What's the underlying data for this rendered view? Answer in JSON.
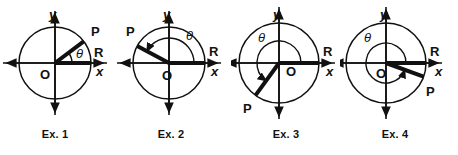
{
  "figure": {
    "background_color": "#ffffff",
    "ink_color": "#111111",
    "panel_count": 4
  },
  "labels": {
    "axis_x": "x",
    "axis_y": "y",
    "origin": "O",
    "point_p": "P",
    "point_r": "R",
    "theta": "θ"
  },
  "panels": [
    {
      "id": "ex1",
      "caption": "Ex. 1",
      "center_x": 55,
      "center_y": 63,
      "radius": 36,
      "terminal_angle_deg": 37,
      "arc_radius": 17,
      "arc_start_deg": 0,
      "arc_end_deg": 37,
      "arrow_on_arc": false,
      "quadrant": 1,
      "label_positions": {
        "y": {
          "x": 49,
          "y": 19
        },
        "x": {
          "x": 96,
          "y": 76
        },
        "O": {
          "x": 40,
          "y": 79
        },
        "P": {
          "x": 91,
          "y": 36
        },
        "R": {
          "x": 94,
          "y": 57
        },
        "theta": {
          "x": 76,
          "y": 58
        }
      }
    },
    {
      "id": "ex2",
      "caption": "Ex. 2",
      "center_x": 53,
      "center_y": 63,
      "radius": 36,
      "terminal_angle_deg": 152,
      "arc_radius": 25,
      "arc_start_deg": 0,
      "arc_end_deg": 152,
      "arrow_on_arc": true,
      "quadrant": 2,
      "label_positions": {
        "y": {
          "x": 47,
          "y": 19
        },
        "x": {
          "x": 95,
          "y": 76
        },
        "O": {
          "x": 46,
          "y": 80
        },
        "P": {
          "x": 10,
          "y": 36
        },
        "R": {
          "x": 93,
          "y": 56
        },
        "theta": {
          "x": 70,
          "y": 40
        }
      }
    },
    {
      "id": "ex3",
      "caption": "Ex. 3",
      "center_x": 48,
      "center_y": 63,
      "radius": 40,
      "terminal_angle_deg": 234,
      "arc_radius": 22,
      "arc_start_deg": 0,
      "arc_end_deg": 234,
      "arrow_on_arc": true,
      "quadrant": 3,
      "label_positions": {
        "y": {
          "x": 42,
          "y": 19
        },
        "x": {
          "x": 95,
          "y": 76
        },
        "O": {
          "x": 55,
          "y": 76
        },
        "P": {
          "x": 12,
          "y": 113
        },
        "R": {
          "x": 92,
          "y": 56
        },
        "theta": {
          "x": 27,
          "y": 42
        }
      }
    },
    {
      "id": "ex4",
      "caption": "Ex. 4",
      "center_x": 46,
      "center_y": 63,
      "radius": 40,
      "terminal_angle_deg": 340,
      "arc_radius": 20,
      "arc_start_deg": 0,
      "arc_end_deg": 340,
      "arrow_on_arc": true,
      "quadrant": 4,
      "label_positions": {
        "y": {
          "x": 40,
          "y": 19
        },
        "x": {
          "x": 95,
          "y": 76
        },
        "O": {
          "x": 36,
          "y": 78
        },
        "P": {
          "x": 86,
          "y": 96
        },
        "R": {
          "x": 90,
          "y": 56
        },
        "theta": {
          "x": 24,
          "y": 42
        }
      }
    }
  ],
  "chart_data": {
    "type": "diagram",
    "series": [
      {
        "name": "Ex. 1",
        "theta_deg": 37,
        "quadrant": 1,
        "terminal_point": "P",
        "initial_point": "R",
        "origin": "O"
      },
      {
        "name": "Ex. 2",
        "theta_deg": 152,
        "quadrant": 2,
        "terminal_point": "P",
        "initial_point": "R",
        "origin": "O"
      },
      {
        "name": "Ex. 3",
        "theta_deg": 234,
        "quadrant": 3,
        "terminal_point": "P",
        "initial_point": "R",
        "origin": "O"
      },
      {
        "name": "Ex. 4",
        "theta_deg": 340,
        "quadrant": 4,
        "terminal_point": "P",
        "initial_point": "R",
        "origin": "O"
      }
    ],
    "xlabel": "x",
    "ylabel": "y",
    "grid": false,
    "legend": "none"
  }
}
